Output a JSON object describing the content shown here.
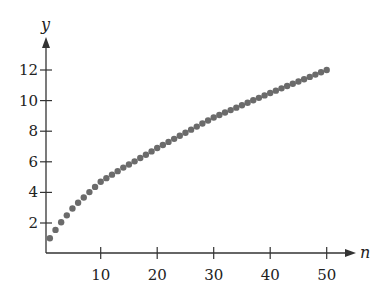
{
  "chart_data": {
    "type": "scatter",
    "title": "",
    "xlabel": "n",
    "ylabel": "y",
    "xlim": [
      0,
      55
    ],
    "ylim": [
      0,
      13.5
    ],
    "grid": false,
    "legend": null,
    "x_ticks": [
      10,
      20,
      30,
      40,
      50
    ],
    "y_ticks": [
      2,
      4,
      6,
      8,
      10,
      12
    ],
    "x_tick_labels": [
      "10",
      "20",
      "30",
      "40",
      "50"
    ],
    "y_tick_labels": [
      "2",
      "4",
      "6",
      "8",
      "10",
      "12"
    ],
    "series": [
      {
        "name": "sequence",
        "color": "#6b6b6b",
        "x": [
          1,
          2,
          3,
          4,
          5,
          6,
          7,
          8,
          9,
          10,
          11,
          12,
          13,
          14,
          15,
          16,
          17,
          18,
          19,
          20,
          21,
          22,
          23,
          24,
          25,
          26,
          27,
          28,
          29,
          30,
          31,
          32,
          33,
          34,
          35,
          36,
          37,
          38,
          39,
          40,
          41,
          42,
          43,
          44,
          45,
          46,
          47,
          48,
          49,
          50
        ],
        "values": [
          1.0,
          1.55,
          2.05,
          2.5,
          2.95,
          3.32,
          3.67,
          4.02,
          4.36,
          4.7,
          4.93,
          5.16,
          5.39,
          5.62,
          5.82,
          6.03,
          6.25,
          6.46,
          6.68,
          6.9,
          7.1,
          7.3,
          7.5,
          7.7,
          7.9,
          8.1,
          8.3,
          8.5,
          8.7,
          8.9,
          9.06,
          9.22,
          9.38,
          9.54,
          9.7,
          9.86,
          10.02,
          10.18,
          10.34,
          10.5,
          10.65,
          10.8,
          10.95,
          11.1,
          11.25,
          11.4,
          11.55,
          11.7,
          11.85,
          12.0
        ]
      }
    ]
  },
  "axes": {
    "x_label": "n",
    "y_label": "y",
    "axis_color": "#333333"
  }
}
